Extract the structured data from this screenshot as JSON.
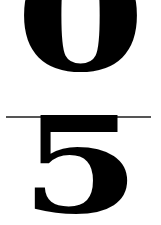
{
  "fraction": {
    "numerator": "0",
    "denominator": "5",
    "bar_color": "#555555",
    "text_color": "#000000"
  }
}
